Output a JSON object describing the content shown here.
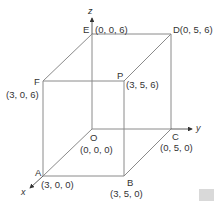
{
  "diagram": {
    "type": "3d-cuboid-coordinates",
    "line_color": "#8a8a8a",
    "text_color": "#333333",
    "axes": {
      "x": "x",
      "y": "y",
      "z": "z"
    },
    "vertices": {
      "O": {
        "name": "O",
        "coords": "(0, 0, 0)"
      },
      "A": {
        "name": "A",
        "coords": "(3, 0, 0)"
      },
      "B": {
        "name": "B",
        "coords": "(3, 5, 0)"
      },
      "C": {
        "name": "C",
        "coords": "(0, 5, 0)"
      },
      "D": {
        "name": "D",
        "coords": "(0, 5, 6)"
      },
      "E": {
        "name": "E",
        "coords": "(0, 0, 6)"
      },
      "F": {
        "name": "F",
        "coords": "(3, 0, 6)"
      },
      "P": {
        "name": "P",
        "coords": "(3, 5, 6)"
      }
    },
    "D_label": "D(0, 5, 6)"
  }
}
